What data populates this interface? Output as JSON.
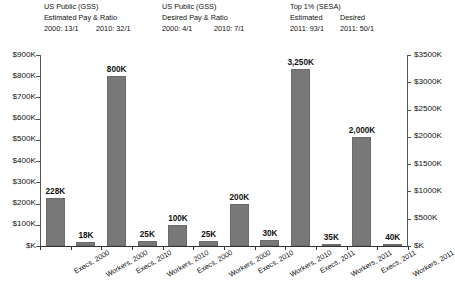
{
  "headers": [
    {
      "name": "us-public-gss-estimated",
      "line1": "US Public (GSS)",
      "line2": "Estimated Pay & Ratio",
      "left_ratio": "2000: 13/1",
      "right_ratio": "2010: 32/1"
    },
    {
      "name": "us-public-gss-desired",
      "line1": "US Public (GSS)",
      "line2": "Desired Pay & Ratio",
      "left_ratio": "2000: 4/1",
      "right_ratio": "2010: 7/1"
    },
    {
      "name": "top-1-percent-sesa",
      "line1": "Top 1% (SESA)",
      "line2_a": "Estimated",
      "line2_b": "Desired",
      "left_ratio": "2011: 93/1",
      "right_ratio": "2011: 50/1"
    }
  ],
  "axes": {
    "left_ticks": [
      "$K",
      "$100K",
      "$200K",
      "$300K",
      "$400K",
      "$500K",
      "$600K",
      "$700K",
      "$800K",
      "$900K"
    ],
    "right_ticks": [
      "$K",
      "$500K",
      "$1000K",
      "$1500K",
      "$2000K",
      "$2500K",
      "$3000K",
      "$3500K"
    ]
  },
  "colors": {
    "bar_fill": "#787878",
    "bar_stroke": "#6a6a6a",
    "axis": "#555555",
    "text": "#111111",
    "background": "#ffffff"
  },
  "chart_data": {
    "type": "bar",
    "title": "",
    "xlabel": "",
    "ylabel": "",
    "grid": false,
    "legend": "none",
    "left_axis": {
      "label": "",
      "ylim": [
        0,
        900000
      ],
      "tick_step": 100000,
      "tick_labels": [
        "$K",
        "$100K",
        "$200K",
        "$300K",
        "$400K",
        "$500K",
        "$600K",
        "$700K",
        "$800K",
        "$900K"
      ]
    },
    "right_axis": {
      "label": "",
      "ylim": [
        0,
        3500000
      ],
      "tick_step": 500000,
      "tick_labels": [
        "$K",
        "$500K",
        "$1000K",
        "$1500K",
        "$2000K",
        "$2500K",
        "$3000K",
        "$3500K"
      ]
    },
    "categories": [
      "Execs, 2000",
      "Workers, 2000",
      "Execs, 2010",
      "Workers, 2010",
      "Execs, 2000",
      "Workers, 2000",
      "Execs, 2010",
      "Workers, 2010",
      "Execs, 2011",
      "Workers, 2011",
      "Execs, 2011",
      "Workers, 2011"
    ],
    "values": [
      228000,
      18000,
      800000,
      25000,
      100000,
      25000,
      200000,
      30000,
      3250000,
      35000,
      2000000,
      40000
    ],
    "data_labels": [
      "228K",
      "18K",
      "800K",
      "25K",
      "100K",
      "25K",
      "200K",
      "30K",
      "3,250K",
      "35K",
      "2,000K",
      "40K"
    ],
    "axis_assignment": [
      "left",
      "left",
      "left",
      "left",
      "left",
      "left",
      "left",
      "left",
      "right",
      "right",
      "right",
      "right"
    ],
    "groups": [
      {
        "name": "US Public (GSS) Estimated Pay & Ratio",
        "ratios": {
          "2000": "13/1",
          "2010": "32/1"
        },
        "bars": [
          0,
          1,
          2,
          3
        ]
      },
      {
        "name": "US Public (GSS) Desired Pay & Ratio",
        "ratios": {
          "2000": "4/1",
          "2010": "7/1"
        },
        "bars": [
          4,
          5,
          6,
          7
        ]
      },
      {
        "name": "Top 1% (SESA)",
        "ratios": {
          "2011 Estimated": "93/1",
          "2011 Desired": "50/1"
        },
        "bars": [
          8,
          9,
          10,
          11
        ]
      }
    ]
  }
}
